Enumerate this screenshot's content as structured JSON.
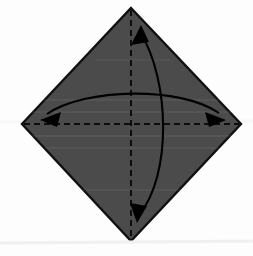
{
  "figure": {
    "background_color": "#fdfdfd",
    "paper_fill_color": "#4b4b4b",
    "paper_edge_color": "#111111",
    "crease_line_color": "#0d0d0d",
    "arrow_color": "#000000",
    "scan_artifact_color": "#eeeeee"
  },
  "paper": {
    "name": "square-sheet",
    "shape": "diamond",
    "vertices": {
      "top": {
        "x": 131,
        "y": 8
      },
      "right": {
        "x": 241,
        "y": 124
      },
      "bottom": {
        "x": 131,
        "y": 241
      },
      "left": {
        "x": 22,
        "y": 124
      }
    },
    "points_attr": "131,8 241,124 131,241 22,124",
    "fill": "#4b4b4b",
    "stroke": "#111111",
    "stroke_width": 2.4
  },
  "creases": [
    {
      "name": "vertical-crease",
      "orientation": "vertical",
      "style": "dashed",
      "x1": 131,
      "y1": 10,
      "x2": 131,
      "y2": 239,
      "stroke": "#0d0d0d",
      "stroke_width": 2,
      "dash_pattern": "6 4"
    },
    {
      "name": "horizontal-crease",
      "orientation": "horizontal",
      "style": "dashed",
      "x1": 24,
      "y1": 124,
      "x2": 239,
      "y2": 124,
      "stroke": "#0d0d0d",
      "stroke_width": 2,
      "dash_pattern": "6 4"
    }
  ],
  "arrows": [
    {
      "name": "vertical-fold-arrow",
      "description": "double-headed curved arrow bulging right, from top vertex to bottom vertex",
      "path": "M 140,32 C 170,80 172,175 139,215",
      "stroke": "#000000",
      "stroke_width": 2.1,
      "heads": [
        {
          "name": "arrowhead-top",
          "points": "140,26 133,44 148,41",
          "rotation_deg": 0
        },
        {
          "name": "arrowhead-bottom",
          "points": "138,222 131,204 146,207",
          "rotation_deg": 0
        }
      ]
    },
    {
      "name": "horizontal-fold-arrow",
      "description": "double-headed curved arrow bulging upward, from left vertex to right vertex",
      "path": "M 47,114 C 85,88 180,86 219,113",
      "stroke": "#000000",
      "stroke_width": 2.1,
      "heads": [
        {
          "name": "arrowhead-left",
          "points": "41,119 60,113 57,126",
          "rotation_deg": 0
        },
        {
          "name": "arrowhead-right",
          "points": "225,119 206,112 209,126",
          "rotation_deg": 0
        }
      ]
    }
  ],
  "artifacts": [
    {
      "name": "scan-line-lower",
      "x1": 0,
      "y1": 243,
      "x2": 253,
      "y2": 241,
      "stroke": "#f0f0f0"
    },
    {
      "name": "scan-line-upper",
      "x1": 0,
      "y1": 122,
      "x2": 253,
      "y2": 121,
      "stroke": "#f7f7f7"
    }
  ]
}
